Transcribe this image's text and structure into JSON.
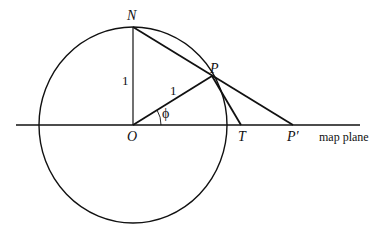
{
  "diagram": {
    "type": "geometry",
    "points": {
      "N": {
        "label": "N",
        "x": 133,
        "y": 27
      },
      "O": {
        "label": "O",
        "x": 133,
        "y": 125
      },
      "P": {
        "label": "P",
        "x": 212,
        "y": 76
      },
      "T": {
        "label": "T",
        "x": 241,
        "y": 125
      },
      "P_prime": {
        "label": "P′",
        "x": 293,
        "y": 125
      }
    },
    "circle": {
      "cx": 133,
      "cy": 125,
      "rx": 94,
      "ry": 98
    },
    "map_plane": {
      "x1": 16,
      "x2": 360,
      "y": 125,
      "label": "map plane"
    },
    "segment_labels": {
      "ON": "1",
      "OP": "1"
    },
    "angle": {
      "label": "ϕ",
      "vertex": "O"
    },
    "colors": {
      "stroke": "#111111",
      "background": "#ffffff"
    }
  }
}
